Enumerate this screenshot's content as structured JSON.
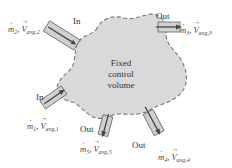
{
  "diagram": {
    "center_label": [
      "Fixed",
      "control",
      "volume"
    ],
    "colors": {
      "volume_fill": "#d9d9d9",
      "boundary": "#777777",
      "pipe_fill": "#d0d0d0",
      "pipe_edge": "#555555",
      "arrow": "#444444"
    },
    "ports": [
      {
        "id": 1,
        "direction": "In",
        "mass_flow": "m",
        "index": "1",
        "velocity": "V",
        "velocity_sub": "avg,1"
      },
      {
        "id": 2,
        "direction": "In",
        "mass_flow": "m",
        "index": "2",
        "velocity": "V",
        "velocity_sub": "avg,2"
      },
      {
        "id": 3,
        "direction": "Out",
        "mass_flow": "m",
        "index": "3",
        "velocity": "V",
        "velocity_sub": "avg,3"
      },
      {
        "id": 4,
        "direction": "Out",
        "mass_flow": "m",
        "index": "4",
        "velocity": "V",
        "velocity_sub": "avg,4"
      },
      {
        "id": 5,
        "direction": "Out",
        "mass_flow": "m",
        "index": "5",
        "velocity": "V",
        "velocity_sub": "avg,5"
      }
    ]
  }
}
